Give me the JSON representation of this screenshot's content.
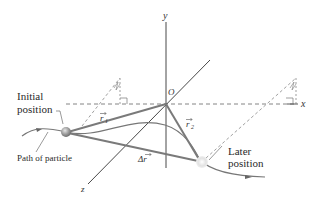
{
  "diagram": {
    "type": "displacement-vector-3d",
    "axes": {
      "x": "x",
      "y": "y",
      "z": "z",
      "origin": "O"
    },
    "labels": {
      "initial_line1": "Initial",
      "initial_line2": "position",
      "later_line1": "Later",
      "later_line2": "position",
      "path": "Path of particle",
      "r1": "r",
      "r1_sub": "1",
      "r2": "r",
      "r2_sub": "2",
      "delta_r": "Δr"
    },
    "colors": {
      "vector": "#7a7a7a",
      "axis": "#333333",
      "dashed": "#666666",
      "particle_initial": "#8c8c8c",
      "particle_later": "#d8d8d8",
      "background": "#ffffff"
    }
  }
}
